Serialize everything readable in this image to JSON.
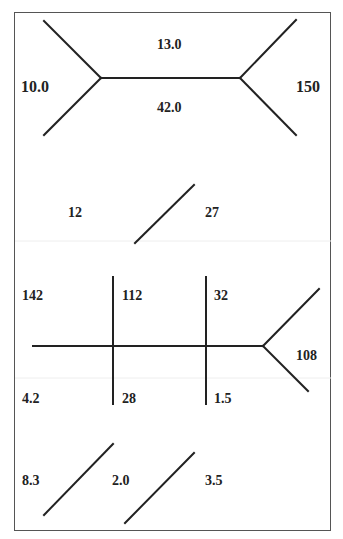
{
  "colors": {
    "line": "#222222",
    "border": "#555555",
    "text": "#222222",
    "background": "#ffffff",
    "artifact": "#eeeeee"
  },
  "sections": {
    "top_tree": {
      "labels": {
        "left": "10.0",
        "top": "13.0",
        "bottom": "42.0",
        "right": "150"
      }
    },
    "single_edge": {
      "labels": {
        "left": "12",
        "right": "27"
      }
    },
    "cross_tree": {
      "labels": {
        "upper_left": "142",
        "upper_middle": "112",
        "upper_right": "32",
        "lower_left": "4.2",
        "lower_middle": "28",
        "lower_right": "1.5",
        "branch_right": "108"
      }
    },
    "parallel_edges": {
      "labels": {
        "left": "8.3",
        "middle": "2.0",
        "right": "3.5"
      }
    }
  }
}
